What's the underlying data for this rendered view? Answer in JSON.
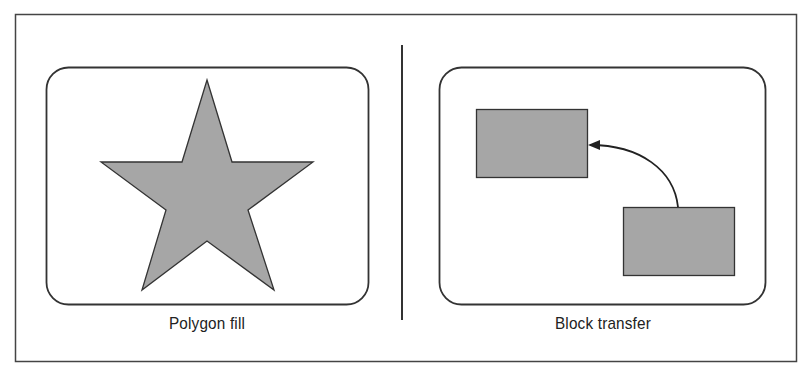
{
  "figure": {
    "panels": [
      {
        "id": "polygon-fill",
        "caption": "Polygon fill",
        "shape": "five-pointed star",
        "fill_color": "#a6a6a6"
      },
      {
        "id": "block-transfer",
        "caption": "Block transfer",
        "shapes": [
          "source rectangle (lower right)",
          "destination rectangle (upper left)"
        ],
        "connector": "curved arrow from lower-right rectangle to upper-left rectangle",
        "fill_color": "#a6a6a6"
      }
    ],
    "colors": {
      "stroke": "#333333",
      "fill": "#a6a6a6",
      "background": "#ffffff"
    }
  }
}
